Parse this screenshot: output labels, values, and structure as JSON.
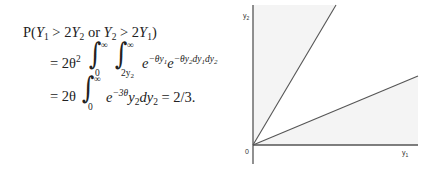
{
  "equation": {
    "line1": {
      "prefix": "P(",
      "Y": "Y",
      "sub1": "1",
      "gt1": " > 2",
      "sub2": "2",
      "or": " or ",
      "sub3": "2",
      "gt2": " > 2",
      "sub4": "1",
      "suffix": ")"
    },
    "line2": {
      "lead": "= 2θ",
      "power": "2",
      "int_outer_upper": "∞",
      "int_outer_lower": "0",
      "int_inner_upper": "∞",
      "int_inner_lower": "2y",
      "int_inner_lower_sub": "2",
      "integrand": "e",
      "exp1": "−θy",
      "exp1_sub": "1",
      "integrand2": "e",
      "exp2": "−θy",
      "exp2_sub": "2",
      "exp2_tail": "dy",
      "exp2_tail_sub": "1",
      "exp2_tail2": "dy",
      "exp2_tail2_sub": "2"
    },
    "line3": {
      "lead": "= 2θ",
      "int_upper": "∞",
      "int_lower": "0",
      "integrand": "e",
      "exp": "−3θ",
      "body": "y",
      "body_sub": "2",
      "d": "dy",
      "d_sub": "2",
      "result": " = 2/3."
    }
  },
  "diagram": {
    "origin_label": "0",
    "x_axis_label": "y",
    "x_axis_label_sub": "1",
    "y_axis_label": "y",
    "y_axis_label_sub": "2",
    "fill_color": "#f4f4f4",
    "line_color": "#555555",
    "regions": [
      {
        "name": "Y2 > 2Y1",
        "bounded_by": "y2 = 2y1 line and y-axis"
      },
      {
        "name": "Y1 > 2Y2",
        "bounded_by": "y2 = y1/2 line and x-axis"
      }
    ]
  }
}
